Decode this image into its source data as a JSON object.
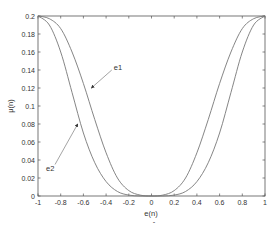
{
  "chart_data": {
    "type": "line",
    "title": "",
    "xlabel": "e(n)",
    "ylabel": "μ(n)",
    "xlim": [
      -1,
      1
    ],
    "ylim": [
      0,
      0.2
    ],
    "grid": false,
    "legend": null,
    "xticks": [
      "-1",
      "-0.8",
      "-0.6",
      "-0.4",
      "-0.2",
      "0",
      "0.2",
      "0.4",
      "0.6",
      "0.8",
      "1"
    ],
    "yticks": [
      "0",
      "0.02",
      "0.04",
      "0.06",
      "0.08",
      "0.1",
      "0.12",
      "0.14",
      "0.16",
      "0.18",
      "0.2"
    ],
    "x": [
      -1,
      -0.9,
      -0.8,
      -0.7,
      -0.6,
      -0.5,
      -0.4,
      -0.3,
      -0.2,
      -0.1,
      0,
      0.1,
      0.2,
      0.3,
      0.4,
      0.5,
      0.6,
      0.7,
      0.8,
      0.9,
      1
    ],
    "series": [
      {
        "name": "e1",
        "values": [
          0.2,
          0.197,
          0.186,
          0.16,
          0.125,
          0.085,
          0.048,
          0.02,
          0.006,
          0.001,
          0,
          0.001,
          0.006,
          0.02,
          0.048,
          0.085,
          0.125,
          0.16,
          0.186,
          0.197,
          0.2
        ]
      },
      {
        "name": "e2",
        "values": [
          0.2,
          0.19,
          0.16,
          0.115,
          0.07,
          0.037,
          0.016,
          0.005,
          0.001,
          0,
          0,
          0,
          0.001,
          0.005,
          0.016,
          0.037,
          0.07,
          0.115,
          0.16,
          0.19,
          0.2
        ]
      }
    ],
    "annotations": [
      {
        "text": "e1",
        "arrow_to": [
          -0.53,
          0.12
        ],
        "text_at": [
          -0.35,
          0.14
        ]
      },
      {
        "text": "e2",
        "arrow_to": [
          -0.65,
          0.08
        ],
        "text_at": [
          -0.85,
          0.035
        ]
      }
    ]
  },
  "labels": {
    "xlabel": "e(n)",
    "ylabel": "μ(n)",
    "e1": "e1",
    "e2": "e2"
  }
}
